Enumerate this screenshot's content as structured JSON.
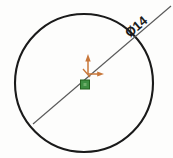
{
  "drawing": {
    "title": "Circle sketch with diameter dimension",
    "background_color": "#fdfdfc"
  },
  "circle": {
    "name": "construction circle",
    "center_x": 84,
    "center_y": 83,
    "radius": 69,
    "stroke_color": "#1a1a1a",
    "stroke_width": 2.1
  },
  "dimension": {
    "label": "Ø14",
    "symbol": "Ø",
    "value": "14",
    "type": "diameter",
    "text_color": "#1a1a1a",
    "line_color": "#5a5a5a",
    "line_x1": 33,
    "line_y1": 124,
    "line_x2": 171,
    "line_y2": 6,
    "text_rotation_deg": -40.5,
    "text_x": 139,
    "text_y": 30
  },
  "origin_marker": {
    "name": "sketch origin",
    "x": 88,
    "y": 74,
    "axis_color": "#c8773a",
    "y_axis_label": "Y",
    "x_axis_label": "X",
    "y_axis_length": 18,
    "x_axis_length": 14
  },
  "origin_point": {
    "name": "origin point",
    "x": 84,
    "y": 83,
    "size": 9,
    "fill_color": "#3f8f43",
    "stroke_color": "#24611f"
  }
}
